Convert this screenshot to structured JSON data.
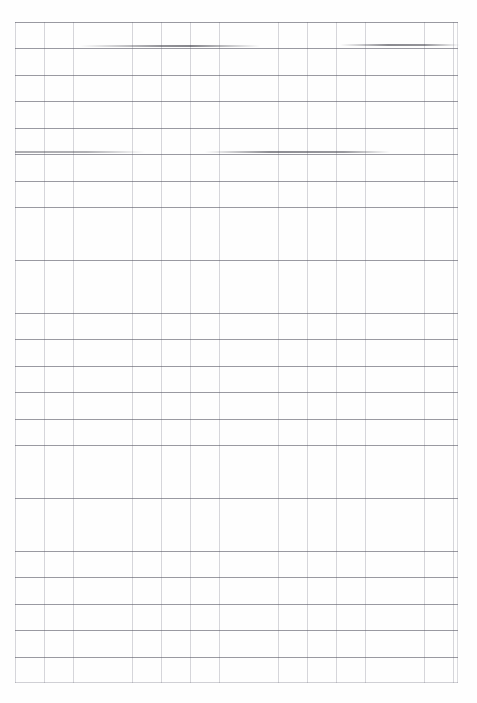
{
  "document": {
    "type": "scanned-grid-paper",
    "title": "Blank grid paper scan",
    "page_width": 477,
    "page_height": 703,
    "background_color": "#ffffff",
    "body_text": ""
  },
  "grid": {
    "label": "ruled grid",
    "origin_x": 15,
    "origin_y": 22,
    "width": 443,
    "height": 661,
    "columns": 15,
    "rows": 25,
    "column_spacing_px": 29.2,
    "row_spacing_px": 26.45,
    "horizontal_line_color": "#5c5c68",
    "vertical_line_color": "#7878877",
    "vertical_line_color_hex": "#787887"
  },
  "artifacts": {
    "label": "scanner streaks",
    "streaks": [
      {
        "name": "streak-upper-left",
        "x": 80,
        "y": 45,
        "width": 180
      },
      {
        "name": "streak-upper-right",
        "x": 340,
        "y": 44,
        "width": 120
      },
      {
        "name": "streak-mid-left",
        "x": 15,
        "y": 151,
        "width": 130
      },
      {
        "name": "streak-mid-right",
        "x": 205,
        "y": 151,
        "width": 185
      }
    ]
  },
  "watermark": {
    "text": "",
    "color": "#cdcdd4"
  }
}
